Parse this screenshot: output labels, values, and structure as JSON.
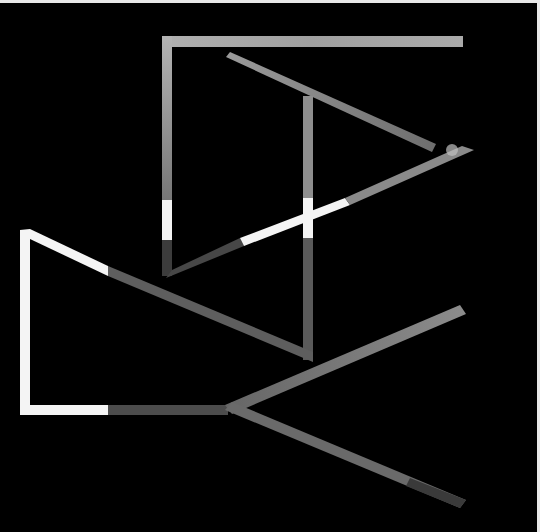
{
  "image": {
    "description": "Abstract geometric line art: light and textured gray bars on black background",
    "background": "#000000",
    "colors": {
      "white": "#f4f4f4",
      "light_gray": "#a8a8a8",
      "mid_gray": "#8a8a8a",
      "dark_texture": "#4a4a4a",
      "frame": "#e8e8e8"
    }
  }
}
